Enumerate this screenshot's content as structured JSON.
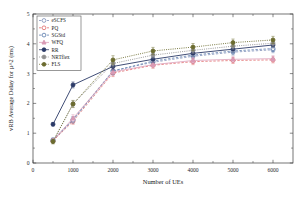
{
  "chart_data": {
    "type": "line",
    "title": "",
    "xlabel": "Number of UEs",
    "ylabel": "vRB Average Delay for µ^2 (ms)",
    "xlim": [
      0,
      6500
    ],
    "ylim": [
      0,
      5
    ],
    "xticks": [
      0,
      1000,
      2000,
      3000,
      4000,
      5000,
      6000
    ],
    "xticklabels": [
      "0",
      "1000",
      "2000",
      "3000",
      "4000",
      "5000",
      "6000"
    ],
    "yticks": [
      0,
      1,
      2,
      3,
      4,
      5
    ],
    "yticklabels": [
      "0",
      "1",
      "2",
      "3",
      "4",
      "5"
    ],
    "grid": false,
    "errorbars": true,
    "legend_position": "upper left",
    "x": [
      500,
      1000,
      2000,
      3000,
      4000,
      5000,
      6000
    ],
    "series": [
      {
        "name": "eSCFS",
        "color": "#7a8bb5",
        "marker": "open-circle",
        "linestyle": "dashed",
        "values": [
          0.78,
          1.46,
          3.1,
          3.38,
          3.58,
          3.72,
          3.8
        ],
        "errors": [
          0.06,
          0.1,
          0.12,
          0.1,
          0.1,
          0.1,
          0.1
        ]
      },
      {
        "name": "PQ",
        "color": "#e06666",
        "marker": "open-circle",
        "linestyle": "dashed",
        "values": [
          0.74,
          1.4,
          3.02,
          3.28,
          3.4,
          3.44,
          3.46
        ],
        "errors": [
          0.06,
          0.1,
          0.12,
          0.1,
          0.1,
          0.1,
          0.1
        ]
      },
      {
        "name": "SGStd",
        "color": "#5577aa",
        "marker": "open-circle",
        "linestyle": "dashed",
        "values": [
          0.76,
          1.44,
          3.08,
          3.42,
          3.62,
          3.76,
          3.84
        ],
        "errors": [
          0.06,
          0.1,
          0.12,
          0.1,
          0.1,
          0.1,
          0.1
        ]
      },
      {
        "name": "WFQ",
        "color": "#d99ab5",
        "marker": "triangle",
        "linestyle": "solid",
        "values": [
          0.76,
          1.5,
          3.06,
          3.3,
          3.44,
          3.48,
          3.5
        ],
        "errors": [
          0.06,
          0.12,
          0.12,
          0.1,
          0.1,
          0.1,
          0.1
        ]
      },
      {
        "name": "RR",
        "color": "#2b3a67",
        "marker": "filled-circle",
        "linestyle": "solid",
        "values": [
          1.3,
          2.62,
          3.24,
          3.48,
          3.68,
          3.82,
          3.96
        ],
        "errors": [
          0.06,
          0.1,
          0.12,
          0.1,
          0.1,
          0.1,
          0.1
        ]
      },
      {
        "name": "NRTflex",
        "color": "#8f8f8f",
        "marker": "filled-circle",
        "linestyle": "dotted",
        "values": [
          0.73,
          1.98,
          3.34,
          3.62,
          3.78,
          3.92,
          4.02
        ],
        "errors": [
          0.06,
          0.1,
          0.12,
          0.1,
          0.1,
          0.1,
          0.1
        ]
      },
      {
        "name": "FLS",
        "color": "#6b6b2e",
        "marker": "filled-circle",
        "linestyle": "dotted",
        "values": [
          0.72,
          1.98,
          3.46,
          3.76,
          3.89,
          4.04,
          4.13
        ],
        "errors": [
          0.08,
          0.12,
          0.14,
          0.12,
          0.12,
          0.12,
          0.12
        ]
      }
    ]
  }
}
